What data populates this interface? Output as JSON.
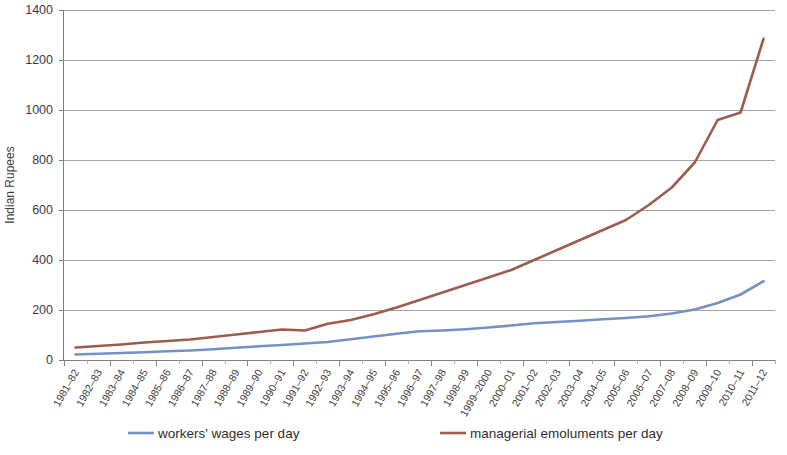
{
  "chart_data": {
    "type": "line",
    "title": "",
    "xlabel": "",
    "ylabel": "Indian Rupees",
    "ylim": [
      0,
      1400
    ],
    "yticks": [
      0,
      200,
      400,
      600,
      800,
      1000,
      1200,
      1400
    ],
    "grid": true,
    "legend_position": "bottom",
    "categories": [
      "1981–82",
      "1982–83",
      "1983–84",
      "1984–85",
      "1985–86",
      "1986–87",
      "1987–88",
      "1988–89",
      "1989–90",
      "1990–91",
      "1991–92",
      "1992–93",
      "1993–94",
      "1994–95",
      "1995–96",
      "1996–97",
      "1997–98",
      "1998–99",
      "1999–2000",
      "2000–01",
      "2001–02",
      "2002–03",
      "2003–04",
      "2004–05",
      "2005–06",
      "2006–07",
      "2007–08",
      "2008–09",
      "2009–10",
      "2010–11",
      "2011–12"
    ],
    "series": [
      {
        "name": "workers' wages per day",
        "color": "#7392c4",
        "values": [
          22,
          25,
          28,
          31,
          35,
          38,
          43,
          49,
          55,
          60,
          66,
          72,
          83,
          94,
          105,
          115,
          118,
          123,
          130,
          138,
          147,
          152,
          157,
          163,
          168,
          175,
          186,
          202,
          228,
          262,
          315
        ]
      },
      {
        "name": "managerial emoluments per day",
        "color": "#9e5c4d",
        "values": [
          50,
          56,
          62,
          70,
          76,
          82,
          92,
          102,
          112,
          122,
          118,
          145,
          160,
          183,
          210,
          240,
          270,
          300,
          330,
          360,
          400,
          440,
          480,
          520,
          560,
          620,
          690,
          790,
          960,
          990,
          1285
        ]
      }
    ]
  },
  "legend": {
    "items": [
      {
        "label": "workers' wages per day",
        "color": "#7392c4"
      },
      {
        "label": "managerial emoluments per day",
        "color": "#9e5c4d"
      }
    ]
  },
  "axes": {
    "y_title": "Indian Rupees",
    "y_tick_labels": [
      "0",
      "200",
      "400",
      "600",
      "800",
      "1000",
      "1200",
      "1400"
    ]
  }
}
